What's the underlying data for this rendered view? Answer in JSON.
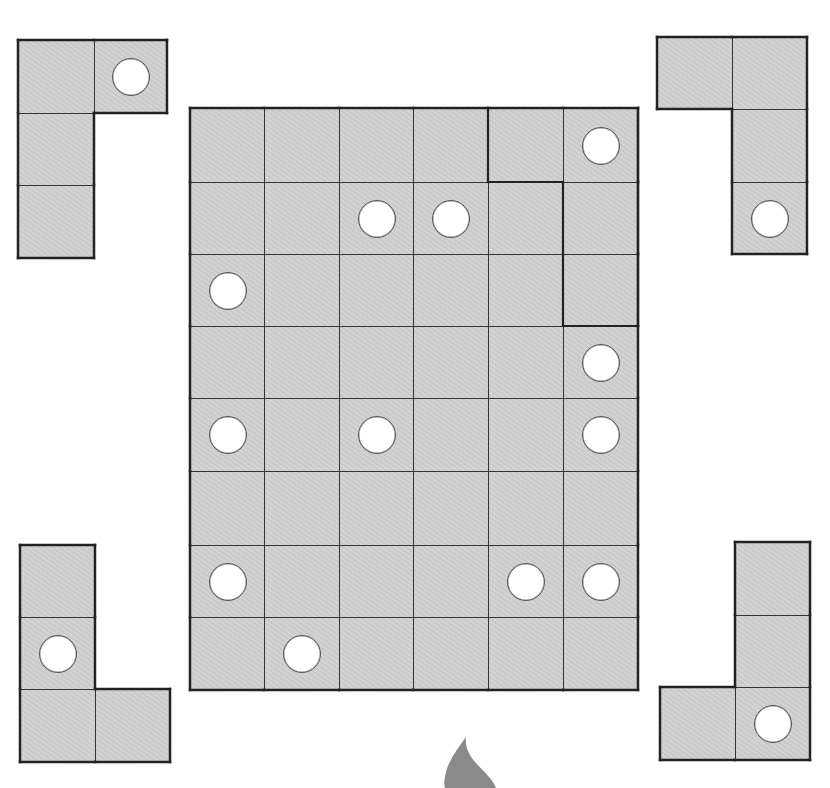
{
  "puzzle": {
    "title": "",
    "colors": {
      "cell_fill": "#d0d0d0",
      "grid_line": "#333333",
      "hole_fill": "#ffffff",
      "hole_border": "#555555",
      "flame": "#8a8a8a"
    },
    "board": {
      "x": 190,
      "y": 108,
      "col_edges": [
        190,
        264,
        339,
        413,
        488,
        563,
        638
      ],
      "row_edges": [
        108,
        182,
        254,
        326,
        398,
        471,
        545,
        617,
        690
      ],
      "cols": 6,
      "rows": 8,
      "holes": [
        [
          0,
          5
        ],
        [
          1,
          2
        ],
        [
          1,
          3
        ],
        [
          2,
          0
        ],
        [
          3,
          5
        ],
        [
          4,
          0
        ],
        [
          4,
          2
        ],
        [
          4,
          5
        ],
        [
          6,
          0
        ],
        [
          6,
          4
        ],
        [
          6,
          5
        ],
        [
          7,
          1
        ]
      ],
      "highlighted_region": {
        "cells": [
          [
            0,
            4
          ],
          [
            0,
            5
          ],
          [
            1,
            5
          ],
          [
            2,
            5
          ]
        ],
        "description": "L-shaped region outlined with thick border"
      }
    },
    "pieces": [
      {
        "name": "piece-top-left",
        "col_edges": [
          18,
          94,
          167
        ],
        "row_edges": [
          40,
          113,
          185,
          258
        ],
        "cells": [
          [
            0,
            0
          ],
          [
            0,
            1
          ],
          [
            1,
            0
          ],
          [
            2,
            0
          ]
        ],
        "holes": [
          [
            0,
            1
          ]
        ]
      },
      {
        "name": "piece-top-right",
        "col_edges": [
          657,
          732,
          807
        ],
        "row_edges": [
          37,
          109,
          182,
          254
        ],
        "cells": [
          [
            0,
            0
          ],
          [
            0,
            1
          ],
          [
            1,
            1
          ],
          [
            2,
            1
          ]
        ],
        "holes": [
          [
            2,
            1
          ]
        ]
      },
      {
        "name": "piece-bottom-left",
        "col_edges": [
          20,
          95,
          170
        ],
        "row_edges": [
          545,
          617,
          689,
          762
        ],
        "cells": [
          [
            0,
            0
          ],
          [
            1,
            0
          ],
          [
            2,
            0
          ],
          [
            2,
            1
          ]
        ],
        "holes": [
          [
            1,
            0
          ]
        ]
      },
      {
        "name": "piece-bottom-right",
        "col_edges": [
          660,
          735,
          810
        ],
        "row_edges": [
          542,
          615,
          687,
          760
        ],
        "cells": [
          [
            0,
            1
          ],
          [
            1,
            1
          ],
          [
            2,
            0
          ],
          [
            2,
            1
          ]
        ],
        "holes": [
          [
            2,
            1
          ]
        ]
      }
    ],
    "decorations": [
      {
        "name": "flame-shape",
        "x": 465,
        "y": 737
      }
    ]
  }
}
